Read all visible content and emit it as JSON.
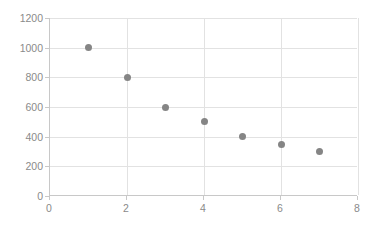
{
  "chart_data": {
    "type": "scatter",
    "title": "",
    "subtitle": "",
    "xlabel": "",
    "ylabel": "",
    "x": [
      1,
      2,
      3,
      4,
      5,
      6,
      7
    ],
    "values": [
      1000,
      800,
      600,
      500,
      400,
      350,
      300
    ],
    "series": [
      {
        "name": "Series 1",
        "points": [
          {
            "x": 1,
            "y": 1000
          },
          {
            "x": 2,
            "y": 800
          },
          {
            "x": 3,
            "y": 600
          },
          {
            "x": 4,
            "y": 500
          },
          {
            "x": 5,
            "y": 400
          },
          {
            "x": 6,
            "y": 350
          },
          {
            "x": 7,
            "y": 300
          }
        ]
      }
    ],
    "xlim": [
      0,
      8
    ],
    "ylim": [
      0,
      1200
    ],
    "xticks": [
      0,
      2,
      4,
      6,
      8
    ],
    "yticks": [
      0,
      200,
      400,
      600,
      800,
      1000,
      1200
    ],
    "xtick_labels": [
      "0",
      "2",
      "4",
      "6",
      "8"
    ],
    "ytick_labels": [
      "0",
      "200",
      "400",
      "600",
      "800",
      "1000",
      "1200"
    ],
    "grid": {
      "horizontal": true,
      "vertical": true
    },
    "legend": {
      "visible": false,
      "position": "none"
    },
    "marker_color": "#858585",
    "gridline_color": "#e2e2e2",
    "axis_color": "#c8c8c8",
    "tick_label_color": "#8a8a8a",
    "background_color": "#ffffff"
  }
}
